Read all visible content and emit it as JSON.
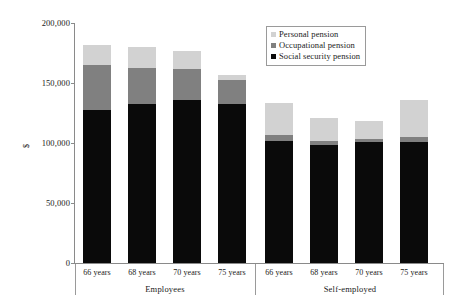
{
  "chart_data": {
    "type": "bar",
    "subtype": "stacked",
    "title": "",
    "xlabel": "",
    "ylabel": "$",
    "ylim": [
      0,
      200000
    ],
    "yticks": [
      0,
      50000,
      100000,
      150000,
      200000
    ],
    "ytick_labels": [
      "0",
      "50,000",
      "100,000",
      "150,000",
      "200,000"
    ],
    "grid": false,
    "legend_position": "top-right",
    "groups": [
      "Employees",
      "Self-employed"
    ],
    "categories": [
      "66 years",
      "68 years",
      "70 years",
      "75 years",
      "66 years",
      "68 years",
      "70 years",
      "75 years"
    ],
    "series": [
      {
        "name": "Social security pension",
        "color": "#0a0a0a",
        "values": [
          128000,
          133000,
          136000,
          133000,
          102000,
          99000,
          101000,
          101000
        ]
      },
      {
        "name": "Occupational pension",
        "color": "#808080",
        "values": [
          37000,
          30000,
          26000,
          20000,
          5000,
          3000,
          3000,
          4000
        ]
      },
      {
        "name": "Personal pension",
        "color": "#d2d2d2",
        "values": [
          17000,
          17000,
          15000,
          4000,
          27000,
          19000,
          15000,
          31000
        ]
      }
    ],
    "totals": [
      182000,
      180000,
      177000,
      157000,
      134000,
      121000,
      119000,
      136000
    ]
  },
  "legend": {
    "entries": [
      {
        "label": "Personal pension",
        "color": "#d2d2d2"
      },
      {
        "label": "Occupational pension",
        "color": "#808080"
      },
      {
        "label": "Social security pension",
        "color": "#0a0a0a"
      }
    ]
  },
  "axis": {
    "y_title": "$",
    "y_labels": [
      "200,000",
      "150,000",
      "100,000",
      "50,000",
      "0"
    ]
  },
  "x_axis": {
    "bar_labels": [
      "66 years",
      "68 years",
      "70 years",
      "75 years",
      "66 years",
      "68 years",
      "70 years",
      "75 years"
    ],
    "group_labels": [
      "Employees",
      "Self-employed"
    ]
  }
}
